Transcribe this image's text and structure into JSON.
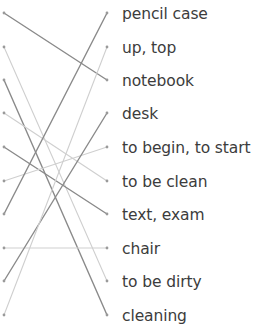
{
  "style": {
    "dark_line_color": "#8a8a8a",
    "light_line_color": "#cfcfcf",
    "dot_color": "#9a9a9a",
    "text_color": "#3c3c3c"
  },
  "left_points": [
    {
      "id": 1,
      "y": 13
    },
    {
      "id": 2,
      "y": 47
    },
    {
      "id": 3,
      "y": 80
    },
    {
      "id": 4,
      "y": 113
    },
    {
      "id": 5,
      "y": 147
    },
    {
      "id": 6,
      "y": 181
    },
    {
      "id": 7,
      "y": 214
    },
    {
      "id": 8,
      "y": 248
    },
    {
      "id": 9,
      "y": 281
    },
    {
      "id": 10,
      "y": 315
    }
  ],
  "right_items": [
    {
      "id": 1,
      "label": "pencil case",
      "y": 13
    },
    {
      "id": 2,
      "label": "up, top",
      "y": 47
    },
    {
      "id": 3,
      "label": "notebook",
      "y": 80
    },
    {
      "id": 4,
      "label": "desk",
      "y": 113
    },
    {
      "id": 5,
      "label": "to begin, to start",
      "y": 147
    },
    {
      "id": 6,
      "label": "to be clean",
      "y": 181
    },
    {
      "id": 7,
      "label": "text, exam",
      "y": 214
    },
    {
      "id": 8,
      "label": "chair",
      "y": 248
    },
    {
      "id": 9,
      "label": "to be dirty",
      "y": 281
    },
    {
      "id": 10,
      "label": "cleaning",
      "y": 315
    }
  ],
  "connections": [
    {
      "from_left": 1,
      "to_right": 3,
      "shade": "dark"
    },
    {
      "from_left": 2,
      "to_right": 9,
      "shade": "light"
    },
    {
      "from_left": 3,
      "to_right": 10,
      "shade": "dark"
    },
    {
      "from_left": 4,
      "to_right": 6,
      "shade": "light"
    },
    {
      "from_left": 5,
      "to_right": 7,
      "shade": "dark"
    },
    {
      "from_left": 6,
      "to_right": 5,
      "shade": "light"
    },
    {
      "from_left": 7,
      "to_right": 1,
      "shade": "dark"
    },
    {
      "from_left": 8,
      "to_right": 8,
      "shade": "light"
    },
    {
      "from_left": 9,
      "to_right": 4,
      "shade": "dark"
    },
    {
      "from_left": 10,
      "to_right": 2,
      "shade": "light"
    }
  ]
}
